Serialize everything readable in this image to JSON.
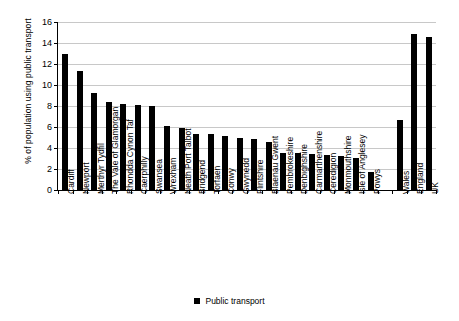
{
  "chart_data": {
    "type": "bar",
    "title": "",
    "xlabel": "",
    "ylabel": "% of population using public transport",
    "ylim": [
      0,
      16
    ],
    "ytick_step": 2,
    "yticks": [
      0,
      2,
      4,
      6,
      8,
      10,
      12,
      14,
      16
    ],
    "grid": true,
    "legend_position": "bottom-center",
    "legend": [
      "Public transport"
    ],
    "series": [
      {
        "name": "Public transport",
        "color": "#000000",
        "values": [
          13.0,
          11.3,
          9.25,
          8.35,
          8.2,
          8.1,
          8.0,
          6.05,
          5.95,
          5.35,
          5.3,
          5.15,
          4.95,
          4.85,
          4.6,
          3.55,
          3.5,
          3.45,
          3.3,
          3.2,
          3.05,
          1.7,
          null,
          6.7,
          14.9,
          14.6
        ]
      }
    ],
    "categories": [
      "Cardiff",
      "Newport",
      "Merthyr Tydfil",
      "The Vale of Glamorgan",
      "Rhondda Cynon Taf",
      "Caerphilly",
      "Swansea",
      "Wrexham",
      "Neath Port Talbot",
      "Bridgend",
      "Torfaen",
      "Conwy",
      "Gwynedd",
      "Flintshire",
      "Blaenau Gwent",
      "Pembrokeshire",
      "Denbighshire",
      "Carmarthenshire",
      "Ceredigion",
      "Monmouthshire",
      "Isle of Anglesey",
      "Powys",
      "",
      "Wales",
      "England",
      "UK"
    ]
  }
}
